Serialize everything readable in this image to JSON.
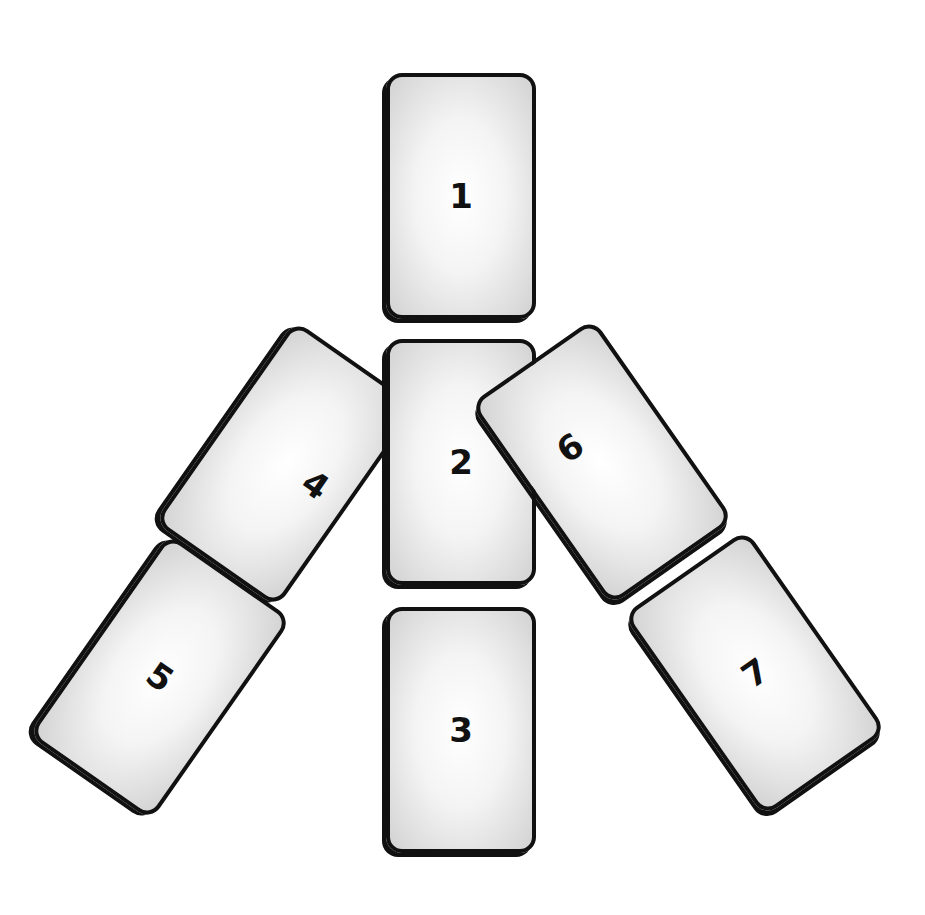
{
  "diagram": {
    "type": "tarot-spread",
    "cards": [
      {
        "label": "1",
        "cx": 461,
        "cy": 196,
        "rotate": 0
      },
      {
        "label": "2",
        "cx": 461,
        "cy": 462,
        "rotate": 0
      },
      {
        "label": "3",
        "cx": 461,
        "cy": 730,
        "rotate": 0
      },
      {
        "label": "4",
        "cx": 286,
        "cy": 464,
        "rotate": 35
      },
      {
        "label": "5",
        "cx": 160,
        "cy": 677,
        "rotate": 35
      },
      {
        "label": "6",
        "cx": 602,
        "cy": 462,
        "rotate": -35
      },
      {
        "label": "7",
        "cx": 755,
        "cy": 673,
        "rotate": -35
      }
    ]
  }
}
